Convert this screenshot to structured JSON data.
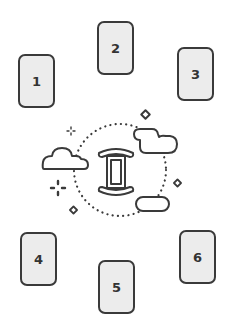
{
  "spread": {
    "cards": [
      {
        "label": "1"
      },
      {
        "label": "2"
      },
      {
        "label": "3"
      },
      {
        "label": "4"
      },
      {
        "label": "5"
      },
      {
        "label": "6"
      }
    ]
  },
  "center": {
    "symbol": "gemini-zodiac",
    "decorations": [
      "cloud",
      "cloud",
      "pill-cloud",
      "diamond-star",
      "diamond-star",
      "diamond-star",
      "sparkle",
      "sparkle",
      "dotted-circle"
    ]
  },
  "colors": {
    "stroke": "#3a3a3a",
    "card_fill": "#ececec",
    "background": "#ffffff"
  }
}
